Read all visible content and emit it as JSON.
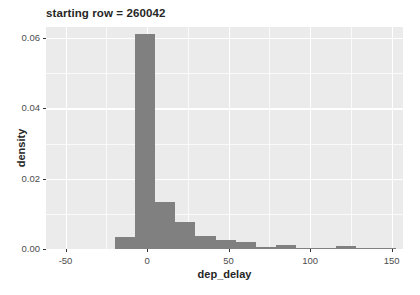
{
  "chart_data": {
    "type": "bar",
    "title": "starting row = 260042",
    "xlabel": "dep_delay",
    "ylabel": "density",
    "xlim": [
      -62,
      157
    ],
    "ylim": [
      0,
      0.0632
    ],
    "grid": true,
    "legend": "none",
    "x_ticks": [
      -50,
      0,
      50,
      100,
      150
    ],
    "x_tick_labels": [
      "-50",
      "0",
      "50",
      "100",
      "150"
    ],
    "y_ticks": [
      0.0,
      0.02,
      0.04,
      0.06
    ],
    "y_tick_labels": [
      "0.00",
      "0.02",
      "0.04",
      "0.06"
    ],
    "x_minor_ticks": [
      -25,
      25,
      75,
      125
    ],
    "y_minor_ticks": [
      0.01,
      0.03,
      0.05
    ],
    "bin_width": 12.3,
    "bar_color": "#808080",
    "panel_color": "#ebebeb",
    "grid_color": "#ffffff",
    "bins": [
      {
        "x_left": -19.5,
        "x_right": -7.2,
        "density": 0.0035
      },
      {
        "x_left": -7.2,
        "x_right": 5.1,
        "density": 0.0613
      },
      {
        "x_left": 5.1,
        "x_right": 17.4,
        "density": 0.0135
      },
      {
        "x_left": 17.4,
        "x_right": 29.7,
        "density": 0.0077
      },
      {
        "x_left": 29.7,
        "x_right": 42.0,
        "density": 0.0038
      },
      {
        "x_left": 42.0,
        "x_right": 54.3,
        "density": 0.0026
      },
      {
        "x_left": 54.3,
        "x_right": 66.6,
        "density": 0.0019
      },
      {
        "x_left": 66.6,
        "x_right": 78.9,
        "density": 0.0005
      },
      {
        "x_left": 78.9,
        "x_right": 91.2,
        "density": 0.0011
      },
      {
        "x_left": 91.2,
        "x_right": 103.5,
        "density": 0.0004
      },
      {
        "x_left": 103.5,
        "x_right": 115.8,
        "density": 0.0004
      },
      {
        "x_left": 115.8,
        "x_right": 128.1,
        "density": 0.001
      },
      {
        "x_left": 128.1,
        "x_right": 140.4,
        "density": 0.0004
      },
      {
        "x_left": 140.4,
        "x_right": 152.7,
        "density": 0.0003
      }
    ]
  }
}
